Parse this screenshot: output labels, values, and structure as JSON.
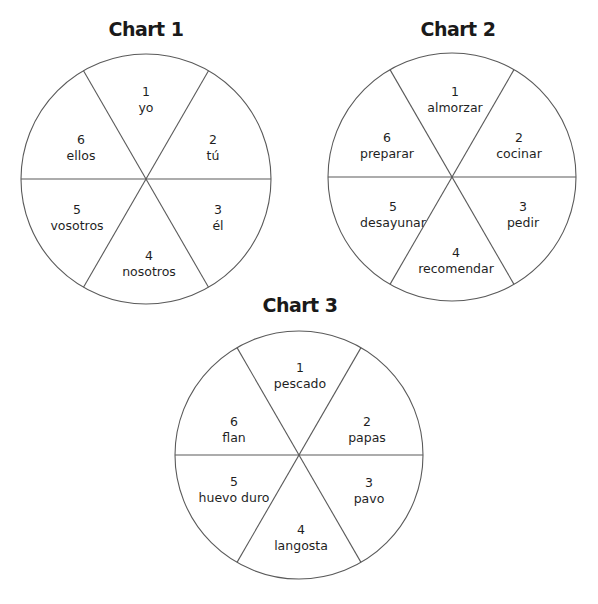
{
  "page": {
    "width": 598,
    "height": 604,
    "line_color": "#5a5a5a",
    "text_color": "#1f1f1f",
    "background": "#ffffff"
  },
  "chart_data": [
    {
      "type": "pie",
      "title": "Chart 1",
      "title_pos": [
        146,
        29
      ],
      "center": [
        146,
        179
      ],
      "radius": 125,
      "sectors": [
        {
          "number": "1",
          "label": "yo",
          "pos": [
            146,
            100
          ]
        },
        {
          "number": "2",
          "label": "tú",
          "pos": [
            213,
            148
          ]
        },
        {
          "number": "3",
          "label": "él",
          "pos": [
            218,
            218
          ]
        },
        {
          "number": "4",
          "label": "nosotros",
          "pos": [
            149,
            264
          ]
        },
        {
          "number": "5",
          "label": "vosotros",
          "pos": [
            77,
            218
          ]
        },
        {
          "number": "6",
          "label": "ellos",
          "pos": [
            81,
            148
          ]
        }
      ],
      "values": [
        1,
        1,
        1,
        1,
        1,
        1
      ]
    },
    {
      "type": "pie",
      "title": "Chart 2",
      "title_pos": [
        458,
        29
      ],
      "center": [
        452,
        177
      ],
      "radius": 124,
      "sectors": [
        {
          "number": "1",
          "label": "almorzar",
          "pos": [
            455,
            100
          ]
        },
        {
          "number": "2",
          "label": "cocinar",
          "pos": [
            519,
            146
          ]
        },
        {
          "number": "3",
          "label": "pedir",
          "pos": [
            523,
            215
          ]
        },
        {
          "number": "4",
          "label": "recomendar",
          "pos": [
            456,
            261
          ]
        },
        {
          "number": "5",
          "label": "desayunar",
          "pos": [
            393,
            215
          ]
        },
        {
          "number": "6",
          "label": "preparar",
          "pos": [
            387,
            146
          ]
        }
      ],
      "values": [
        1,
        1,
        1,
        1,
        1,
        1
      ]
    },
    {
      "type": "pie",
      "title": "Chart 3",
      "title_pos": [
        300,
        305
      ],
      "center": [
        299,
        455
      ],
      "radius": 124,
      "sectors": [
        {
          "number": "1",
          "label": "pescado",
          "pos": [
            300,
            376
          ]
        },
        {
          "number": "2",
          "label": "papas",
          "pos": [
            367,
            430
          ]
        },
        {
          "number": "3",
          "label": "pavo",
          "pos": [
            369,
            491
          ]
        },
        {
          "number": "4",
          "label": "langosta",
          "pos": [
            301,
            538
          ]
        },
        {
          "number": "5",
          "label": "huevo duro",
          "pos": [
            234,
            490
          ]
        },
        {
          "number": "6",
          "label": "flan",
          "pos": [
            234,
            430
          ]
        }
      ],
      "values": [
        1,
        1,
        1,
        1,
        1,
        1
      ]
    }
  ]
}
